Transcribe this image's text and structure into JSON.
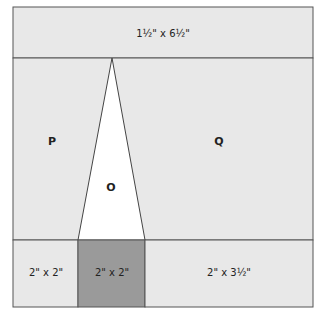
{
  "diagram": {
    "colors": {
      "light_fill": "#e8e8e8",
      "dark_fill": "#9a9a9a",
      "triangle_fill": "#ffffff",
      "line": "#555555"
    },
    "top_band": {
      "label": "1½\" x 6½\""
    },
    "middle": {
      "left_label": "P",
      "right_label": "Q",
      "triangle_label": "O"
    },
    "bottom_band": {
      "cells": [
        {
          "label": "2\" x 2\""
        },
        {
          "label": "2\" x 2\""
        },
        {
          "label": "2\" x 3½\""
        }
      ]
    }
  }
}
